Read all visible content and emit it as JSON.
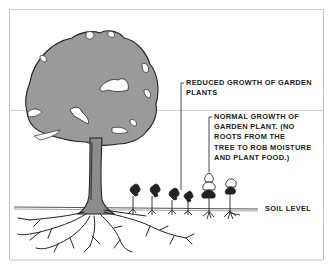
{
  "diagram": {
    "labels": {
      "reduced_growth": "REDUCED GROWTH OF GARDEN\nPLANTS",
      "normal_growth": "NORMAL GROWTH OF\nGARDEN PLANT.  (NO\nROOTS FROM THE\nTREE TO ROB MOISTURE\nAND PLANT FOOD.)",
      "soil_level": "SOIL LEVEL"
    },
    "elements": {
      "tree": "tree-with-spreading-roots",
      "reduced_plants_count": 5,
      "normal_plants_count": 2
    },
    "colors": {
      "canopy": "#9a9a9a",
      "trunk": "#8c8c8c",
      "line": "#222222",
      "border": "#bdbdbd"
    }
  }
}
